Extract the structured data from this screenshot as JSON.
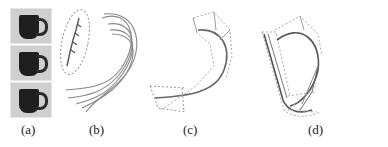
{
  "figure": {
    "panels": [
      {
        "id": "a",
        "label": "(a)",
        "content": "three photographs of a dark mug"
      },
      {
        "id": "b",
        "label": "(b)",
        "content": "dashed ellipse around small arrow sketch and fan of curved strokes"
      },
      {
        "id": "c",
        "label": "(c)",
        "content": "single curved stroke with dashed cross-section frames"
      },
      {
        "id": "d",
        "label": "(d)",
        "content": "two curved strokes with dashed frames"
      }
    ],
    "colors": {
      "stroke": "#777777",
      "dashed": "#a8a8a8",
      "mug": "#1e1e1e",
      "photo_bg": "#cfcfcf"
    }
  }
}
